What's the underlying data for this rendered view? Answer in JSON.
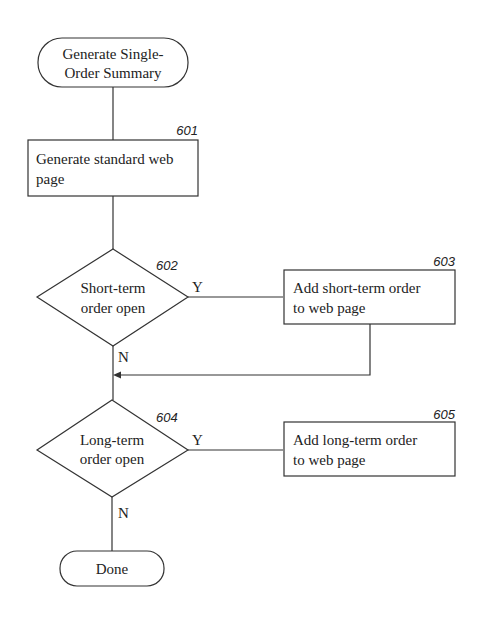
{
  "diagram": {
    "start": {
      "line1": "Generate Single-",
      "line2": "Order Summary"
    },
    "step601": {
      "ref": "601",
      "line1": "Generate standard web",
      "line2": "page"
    },
    "step602": {
      "ref": "602",
      "line1": "Short-term",
      "line2": "order open",
      "yes": "Y",
      "no": "N"
    },
    "step603": {
      "ref": "603",
      "line1": "Add short-term order",
      "line2": "to web page"
    },
    "step604": {
      "ref": "604",
      "line1": "Long-term",
      "line2": "order open",
      "yes": "Y",
      "no": "N"
    },
    "step605": {
      "ref": "605",
      "line1": "Add long-term order",
      "line2": "to web page"
    },
    "end": {
      "label": "Done"
    }
  }
}
